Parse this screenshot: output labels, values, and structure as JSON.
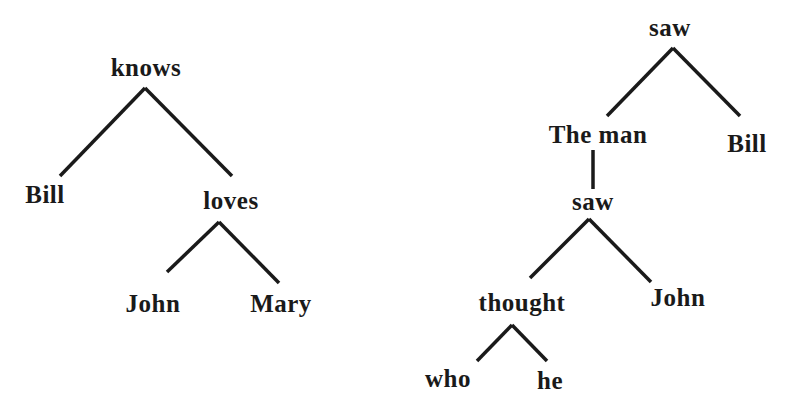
{
  "trees": [
    {
      "name": "tree-knows",
      "nodes": {
        "knows": "knows",
        "bill": "Bill",
        "loves": "loves",
        "john": "John",
        "mary": "Mary"
      },
      "edges": [
        [
          "knows",
          "Bill"
        ],
        [
          "knows",
          "loves"
        ],
        [
          "loves",
          "John"
        ],
        [
          "loves",
          "Mary"
        ]
      ]
    },
    {
      "name": "tree-saw",
      "nodes": {
        "saw_root": "saw",
        "the_man": "The man",
        "bill": "Bill",
        "saw_rel": "saw",
        "thought": "thought",
        "john": "John",
        "who": "who",
        "he": "he"
      },
      "edges": [
        [
          "saw",
          "The man"
        ],
        [
          "saw",
          "Bill"
        ],
        [
          "The man",
          "saw"
        ],
        [
          "saw",
          "thought"
        ],
        [
          "saw",
          "John"
        ],
        [
          "thought",
          "who"
        ],
        [
          "thought",
          "he"
        ]
      ]
    }
  ]
}
